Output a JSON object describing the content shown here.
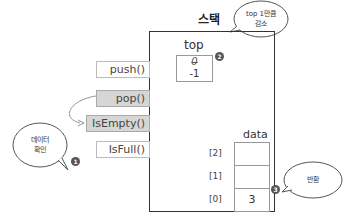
{
  "diagram": {
    "title": "스택",
    "methods": [
      {
        "label": "push()",
        "highlighted": false
      },
      {
        "label": "pop()",
        "highlighted": true
      },
      {
        "label": "IsEmpty()",
        "highlighted": true
      },
      {
        "label": "IsFull()",
        "highlighted": false
      }
    ],
    "top": {
      "label": "top",
      "old_value": "0",
      "new_value": "-1"
    },
    "data": {
      "label": "data",
      "cells": [
        {
          "index": "[2]",
          "value": ""
        },
        {
          "index": "[1]",
          "value": ""
        },
        {
          "index": "[0]",
          "value": "3"
        }
      ]
    },
    "callouts": [
      {
        "step": "1",
        "text_line1": "데이터",
        "text_line2": "확인"
      },
      {
        "step": "2",
        "text_line1": "top 1만큼",
        "text_line2": "감소"
      },
      {
        "step": "3",
        "text_line1": "반환",
        "text_line2": ""
      }
    ]
  }
}
